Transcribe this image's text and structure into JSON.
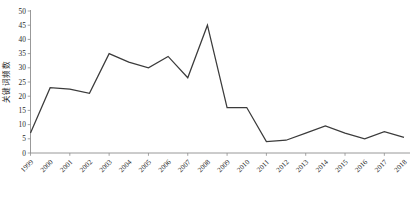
{
  "chart_data": {
    "type": "line",
    "title": "",
    "xlabel": "",
    "ylabel": "关键词频数",
    "ylim": [
      0,
      50
    ],
    "yticks": [
      0,
      5,
      10,
      15,
      20,
      25,
      30,
      35,
      40,
      45,
      50
    ],
    "grid": false,
    "legend": null,
    "line_color": "#3b3b3b",
    "categories": [
      "1999",
      "2000",
      "2001",
      "2002",
      "2003",
      "2004",
      "2005",
      "2006",
      "2007",
      "2008",
      "2009",
      "2010",
      "2011",
      "2012",
      "2013",
      "2014",
      "2015",
      "2016",
      "2017",
      "2018"
    ],
    "values": [
      7,
      23,
      22.5,
      21,
      35,
      32,
      30,
      34,
      26.5,
      45,
      16,
      16,
      4,
      4.5,
      7,
      9.5,
      7,
      5,
      7.5,
      5.5
    ],
    "series": [
      {
        "name": "关键词频数",
        "values": [
          7,
          23,
          22.5,
          21,
          35,
          32,
          30,
          34,
          26.5,
          45,
          16,
          16,
          4,
          4.5,
          7,
          9.5,
          7,
          5,
          7.5,
          5.5
        ]
      }
    ],
    "annotations": []
  },
  "axes": {
    "y_axis_label": "关键词频数",
    "y_tick_labels": [
      "50",
      "45",
      "40",
      "35",
      "30",
      "25",
      "20",
      "15",
      "10",
      "5",
      "0"
    ],
    "x_tick_labels": [
      "1999",
      "2000",
      "2001",
      "2002",
      "2003",
      "2004",
      "2005",
      "2006",
      "2007",
      "2008",
      "2009",
      "2010",
      "2011",
      "2012",
      "2013",
      "2014",
      "2015",
      "2016",
      "2017",
      "2018"
    ]
  }
}
